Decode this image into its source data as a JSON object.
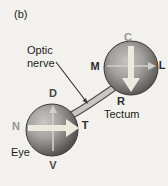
{
  "figure_label": "(b)",
  "optic_nerve": {
    "label_line1": "Optic",
    "label_line2": "nerve"
  },
  "eye": {
    "name": "Eye",
    "labels": {
      "top": "D",
      "bottom": "V",
      "left": "N",
      "right": "T"
    },
    "thick_arrow": "nasal-to-temporal",
    "thin_arrow": "ventral-to-dorsal"
  },
  "tectum": {
    "name": "Tectum",
    "labels": {
      "top": "C",
      "bottom": "R",
      "left": "M",
      "right": "L"
    },
    "thick_arrow": "caudal-to-rostral",
    "thin_arrow": "medial-to-lateral"
  },
  "colors": {
    "background": "#f2f1ed",
    "sphere_highlight": "#c8c6c2",
    "sphere_rim": "#3c3a38",
    "thick_arrow": "#edeadd",
    "thin_arrow": "#d2d0cb",
    "nerve_fill": "#c9c7c2",
    "nerve_outline": "#54524e",
    "muted_label": "#96948f",
    "dark_label": "#2e2c2a"
  }
}
